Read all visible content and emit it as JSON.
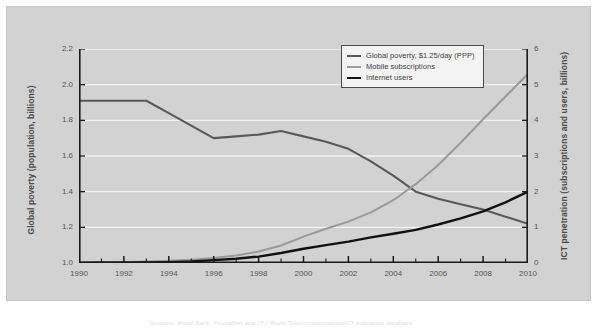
{
  "figure": {
    "background_color": "#d2d2d2",
    "plot_background_color": "#d2d2d2",
    "gridline_color": "#f2f2f2",
    "axis_color": "#1a1a1a"
  },
  "caption": {
    "text": "Sources: World Bank, PovcalNet and ITU World Telecommunication/ICT Indicators database"
  },
  "legend": {
    "position": "top-right",
    "items": [
      {
        "label": "Global poverty, $1.25/day (PPP)",
        "color": "#595959",
        "icon": "line-swatch-icon"
      },
      {
        "label": "Mobile subscriptions",
        "color": "#9a9a9a",
        "icon": "line-swatch-icon"
      },
      {
        "label": "Internet users",
        "color": "#111111",
        "icon": "line-swatch-icon"
      }
    ]
  },
  "chart_data": {
    "type": "line",
    "title": "",
    "xlabel": "",
    "ylabel": "Global poverty (population, billions)",
    "y2label": "ICT penetration (subscriptions and users, billions)",
    "xlim": [
      1990,
      2010
    ],
    "ylim": [
      1.0,
      2.2
    ],
    "y2lim": [
      0,
      6
    ],
    "grid": true,
    "x": [
      1990,
      1991,
      1992,
      1993,
      1994,
      1995,
      1996,
      1997,
      1998,
      1999,
      2000,
      2001,
      2002,
      2003,
      2004,
      2005,
      2006,
      2007,
      2008,
      2009,
      2010
    ],
    "xticks": [
      1990,
      1992,
      1994,
      1996,
      1998,
      2000,
      2002,
      2004,
      2006,
      2008,
      2010
    ],
    "xtick_labels": [
      "1990",
      "1992",
      "1994",
      "1996",
      "1998",
      "2000",
      "2002",
      "2004",
      "2006",
      "2008",
      "2010"
    ],
    "yticks": [
      1.0,
      1.2,
      1.4,
      1.6,
      1.8,
      2.0,
      2.2
    ],
    "ytick_labels": [
      "1.0",
      "1.2",
      "1.4",
      "1.6",
      "1.8",
      "2.0",
      "2.2"
    ],
    "y2ticks": [
      0,
      1,
      2,
      3,
      4,
      5,
      6
    ],
    "y2tick_labels": [
      "0",
      "1",
      "2",
      "3",
      "4",
      "5",
      "6"
    ],
    "series": [
      {
        "name": "Global poverty, $1.25/day (PPP)",
        "axis": "left",
        "color": "#595959",
        "width": 2.1,
        "values": [
          1.91,
          1.91,
          1.91,
          1.91,
          1.84,
          1.77,
          1.7,
          1.71,
          1.72,
          1.74,
          1.71,
          1.68,
          1.64,
          1.57,
          1.49,
          1.4,
          1.36,
          1.33,
          1.3,
          1.26,
          1.22
        ]
      },
      {
        "name": "Mobile subscriptions",
        "axis": "right",
        "color": "#9a9a9a",
        "width": 2.0,
        "values": [
          0.01,
          0.02,
          0.03,
          0.04,
          0.06,
          0.09,
          0.14,
          0.21,
          0.32,
          0.49,
          0.74,
          0.96,
          1.16,
          1.42,
          1.76,
          2.21,
          2.75,
          3.37,
          4.03,
          4.67,
          5.3
        ]
      },
      {
        "name": "Internet users",
        "axis": "right",
        "color": "#111111",
        "width": 2.4,
        "values": [
          0.003,
          0.005,
          0.008,
          0.014,
          0.025,
          0.04,
          0.08,
          0.12,
          0.18,
          0.28,
          0.4,
          0.5,
          0.6,
          0.72,
          0.82,
          0.93,
          1.08,
          1.25,
          1.45,
          1.7,
          2.0
        ]
      }
    ]
  }
}
